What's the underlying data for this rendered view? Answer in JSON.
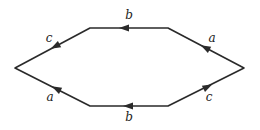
{
  "diagram": {
    "type": "hexagon-edge-labeling",
    "vertices": {
      "left": [
        15,
        68
      ],
      "top_left": [
        90,
        28
      ],
      "top_right": [
        168,
        28
      ],
      "right": [
        244,
        68
      ],
      "bottom_right": [
        168,
        106
      ],
      "bottom_left": [
        90,
        106
      ]
    },
    "edges": [
      {
        "id": "top",
        "label": "b",
        "from": "top_right",
        "to": "top_left",
        "label_pos": [
          129,
          19
        ]
      },
      {
        "id": "top-right",
        "label": "a",
        "from": "right",
        "to": "top_right",
        "label_pos": [
          212,
          42
        ]
      },
      {
        "id": "top-left",
        "label": "c",
        "from": "top_left",
        "to": "left",
        "label_pos": [
          49,
          42
        ]
      },
      {
        "id": "bottom-left",
        "label": "a",
        "from": "bottom_left",
        "to": "left",
        "label_pos": [
          50,
          101
        ]
      },
      {
        "id": "bottom-right",
        "label": "c",
        "from": "bottom_right",
        "to": "right",
        "label_pos": [
          209,
          101
        ]
      },
      {
        "id": "bottom",
        "label": "b",
        "from": "bottom_right",
        "to": "bottom_left",
        "label_pos": [
          129,
          121
        ]
      }
    ],
    "colors": {
      "stroke": "#2a2a2a",
      "background": "#ffffff"
    }
  }
}
